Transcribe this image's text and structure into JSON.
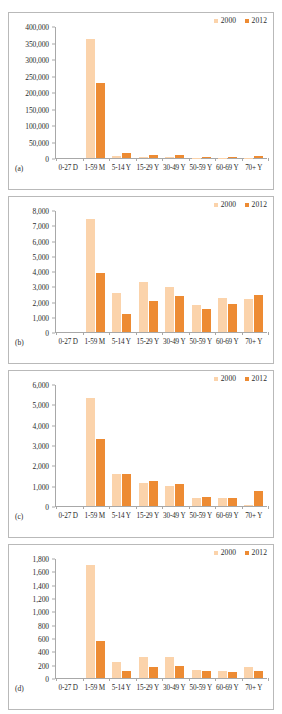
{
  "figure": {
    "legend": [
      {
        "label": "2000",
        "color": "#fbd3ab"
      },
      {
        "label": "2012",
        "color": "#ed8b33"
      }
    ],
    "categories": [
      "0-27 D",
      "1-59 M",
      "5-14 Y",
      "15-29 Y",
      "30-49 Y",
      "50-59 Y",
      "60-69 Y",
      "70+ Y"
    ]
  },
  "chart_data": [
    {
      "type": "bar",
      "panel": "(a)",
      "title": "",
      "xlabel": "",
      "ylabel": "",
      "categories": [
        "0-27 D",
        "1-59 M",
        "5-14 Y",
        "15-29 Y",
        "30-49 Y",
        "50-59 Y",
        "60-69 Y",
        "70+ Y"
      ],
      "yticks": [
        "0",
        "50,000",
        "100,000",
        "150,000",
        "200,000",
        "250,000",
        "300,000",
        "350,000",
        "400,000"
      ],
      "ylim": [
        0,
        400000
      ],
      "grid": false,
      "legend_position": "top-right",
      "series": [
        {
          "name": "2000",
          "color": "#fbd3ab",
          "values": [
            0,
            361000,
            5000,
            2500,
            2500,
            1200,
            1000,
            1500
          ]
        },
        {
          "name": "2012",
          "color": "#ed8b33",
          "values": [
            0,
            226000,
            14000,
            9000,
            9000,
            2500,
            2500,
            6000
          ]
        }
      ]
    },
    {
      "type": "bar",
      "panel": "(b)",
      "title": "",
      "xlabel": "",
      "ylabel": "",
      "categories": [
        "0-27 D",
        "1-59 M",
        "5-14 Y",
        "15-29 Y",
        "30-49 Y",
        "50-59 Y",
        "60-69 Y",
        "70+ Y"
      ],
      "yticks": [
        "0",
        "1,000",
        "2,000",
        "3,000",
        "4,000",
        "5,000",
        "6,000",
        "7,000",
        "8,000"
      ],
      "ylim": [
        0,
        8000
      ],
      "grid": false,
      "legend_position": "top-right",
      "series": [
        {
          "name": "2000",
          "color": "#fbd3ab",
          "values": [
            0,
            7420,
            2540,
            3270,
            2920,
            1800,
            2240,
            2190
          ]
        },
        {
          "name": "2012",
          "color": "#ed8b33",
          "values": [
            0,
            3860,
            1160,
            2010,
            2350,
            1500,
            1840,
            2400
          ]
        }
      ]
    },
    {
      "type": "bar",
      "panel": "(c)",
      "title": "",
      "xlabel": "",
      "ylabel": "",
      "categories": [
        "0-27 D",
        "1-59 M",
        "5-14 Y",
        "15-29 Y",
        "30-49 Y",
        "50-59 Y",
        "60-69 Y",
        "70+ Y"
      ],
      "yticks": [
        "0",
        "1,000",
        "2,000",
        "3,000",
        "4,000",
        "5,000",
        "6,000"
      ],
      "ylim": [
        0,
        6000
      ],
      "grid": false,
      "legend_position": "top-right",
      "series": [
        {
          "name": "2000",
          "color": "#fbd3ab",
          "values": [
            0,
            5310,
            1560,
            1120,
            1000,
            390,
            400,
            60
          ]
        },
        {
          "name": "2012",
          "color": "#ed8b33",
          "values": [
            0,
            3320,
            1580,
            1220,
            1060,
            420,
            380,
            730
          ]
        }
      ]
    },
    {
      "type": "bar",
      "panel": "(d)",
      "title": "",
      "xlabel": "",
      "ylabel": "",
      "categories": [
        "0-27 D",
        "1-59 M",
        "5-14 Y",
        "15-29 Y",
        "30-49 Y",
        "50-59 Y",
        "60-69 Y",
        "70+ Y"
      ],
      "yticks": [
        "0",
        "200",
        "400",
        "600",
        "800",
        "1,000",
        "1,200",
        "1,400",
        "1,600",
        "1,800"
      ],
      "ylim": [
        0,
        1800
      ],
      "grid": false,
      "legend_position": "top-right",
      "series": [
        {
          "name": "2000",
          "color": "#fbd3ab",
          "values": [
            0,
            1700,
            245,
            310,
            308,
            120,
            110,
            170
          ]
        },
        {
          "name": "2012",
          "color": "#ed8b33",
          "values": [
            0,
            555,
            100,
            170,
            178,
            100,
            85,
            108
          ]
        }
      ]
    }
  ]
}
